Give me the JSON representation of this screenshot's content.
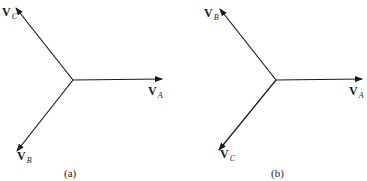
{
  "diagrams": [
    {
      "id": "a",
      "caption": "(a)",
      "phasors": [
        {
          "name": "V_A",
          "symbol": "V",
          "subscript": "A",
          "angle_deg": 0
        },
        {
          "name": "V_B",
          "symbol": "V",
          "subscript": "B",
          "angle_deg": -120
        },
        {
          "name": "V_C",
          "symbol": "V",
          "subscript": "C",
          "angle_deg": 120
        }
      ]
    },
    {
      "id": "b",
      "caption": "(b)",
      "phasors": [
        {
          "name": "V_A",
          "symbol": "V",
          "subscript": "A",
          "angle_deg": 0
        },
        {
          "name": "V_B",
          "symbol": "V",
          "subscript": "B",
          "angle_deg": 120
        },
        {
          "name": "V_C",
          "symbol": "V",
          "subscript": "C",
          "angle_deg": -120
        }
      ]
    }
  ],
  "colors": {
    "line": "#1a1a1a",
    "background": "#ffffff"
  }
}
